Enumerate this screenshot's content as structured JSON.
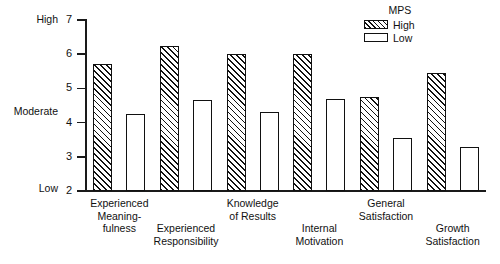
{
  "chart_data": {
    "type": "bar",
    "title": "",
    "xlabel": "",
    "ylabel": "",
    "ylim": [
      2,
      7
    ],
    "yticks": [
      2,
      3,
      4,
      5,
      6,
      7
    ],
    "ytick_labels": [
      "2",
      "3",
      "4",
      "5",
      "6",
      "7"
    ],
    "y_anchor_labels": [
      {
        "text": "High",
        "value": 7
      },
      {
        "text": "Moderate",
        "value": 4.5
      },
      {
        "text": "Low",
        "value": 2
      }
    ],
    "grid": false,
    "legend_position": "top-right",
    "legend_title": "MPS",
    "categories": [
      "Experienced\nMeaning-\nfulness",
      "Experienced\nResponsibility",
      "Knowledge\nof Results",
      "Internal\nMotivation",
      "General\nSatisfaction",
      "Growth\nSatisfaction"
    ],
    "series": [
      {
        "name": "High",
        "fill": "hatched",
        "color": "#111111",
        "values": [
          5.7,
          6.25,
          6.0,
          6.0,
          4.75,
          5.45
        ]
      },
      {
        "name": "Low",
        "fill": "open",
        "color": "#ffffff",
        "values": [
          4.25,
          4.65,
          4.3,
          4.7,
          3.55,
          3.3
        ]
      }
    ]
  },
  "legend": {
    "title": "MPS",
    "entries": [
      {
        "label": "High",
        "style": "high"
      },
      {
        "label": "Low",
        "style": "low"
      }
    ]
  },
  "axis": {
    "high_label": "High",
    "moderate_label": "Moderate",
    "low_label": "Low"
  },
  "colors": {
    "ink": "#111111",
    "background": "#ffffff"
  }
}
